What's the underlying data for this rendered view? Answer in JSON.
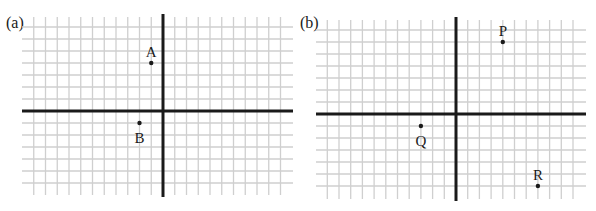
{
  "panels": [
    {
      "id": "a",
      "label": "(a)",
      "x_range": [
        -12,
        10
      ],
      "y_range": [
        -6,
        7
      ],
      "points": [
        {
          "name": "A",
          "x": -1,
          "y": 4,
          "label_pos": "above"
        },
        {
          "name": "B",
          "x": -2,
          "y": -1,
          "label_pos": "below"
        }
      ]
    },
    {
      "id": "b",
      "label": "(b)",
      "x_range": [
        -11,
        11
      ],
      "y_range": [
        -6,
        7
      ],
      "points": [
        {
          "name": "P",
          "x": 4,
          "y": 6,
          "label_pos": "above"
        },
        {
          "name": "Q",
          "x": -3,
          "y": -1,
          "label_pos": "below"
        },
        {
          "name": "R",
          "x": 7,
          "y": -6,
          "label_pos": "above"
        }
      ]
    }
  ],
  "chart_data": [
    {
      "type": "scatter",
      "title": "(a)",
      "xlabel": "",
      "ylabel": "",
      "grid": true,
      "series": [
        {
          "name": "points",
          "labels": [
            "A",
            "B"
          ],
          "x": [
            -1,
            -2
          ],
          "y": [
            4,
            -1
          ]
        }
      ]
    },
    {
      "type": "scatter",
      "title": "(b)",
      "xlabel": "",
      "ylabel": "",
      "grid": true,
      "series": [
        {
          "name": "points",
          "labels": [
            "P",
            "Q",
            "R"
          ],
          "x": [
            4,
            -3,
            7
          ],
          "y": [
            6,
            -1,
            -6
          ]
        }
      ]
    }
  ]
}
